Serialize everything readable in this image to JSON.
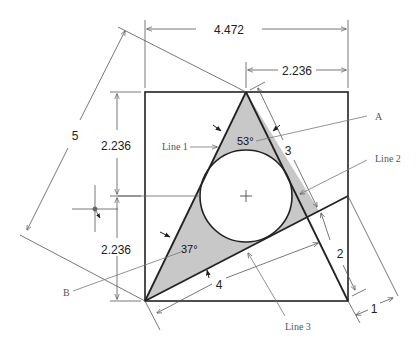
{
  "diagram": {
    "type": "geometric construction drawing",
    "square": {
      "side": "2.236 x 2 = 4.472"
    },
    "dimensions": {
      "top_width": "4.472",
      "top_half_width": "2.236",
      "left_upper_height": "2.236",
      "left_lower_height": "2.236",
      "hypotenuse_long": "5",
      "side_3": "3",
      "side_4": "4",
      "side_2": "2",
      "side_1": "1"
    },
    "angles": {
      "apex": "53°",
      "base_left": "37°"
    },
    "callouts": {
      "line1": "Line 1",
      "line2": "Line 2",
      "line3": "Line 3",
      "point_a": "A",
      "point_b": "B"
    },
    "colors": {
      "shade": "#c8c8c8",
      "stroke": "#222222",
      "thin": "#555555"
    }
  }
}
